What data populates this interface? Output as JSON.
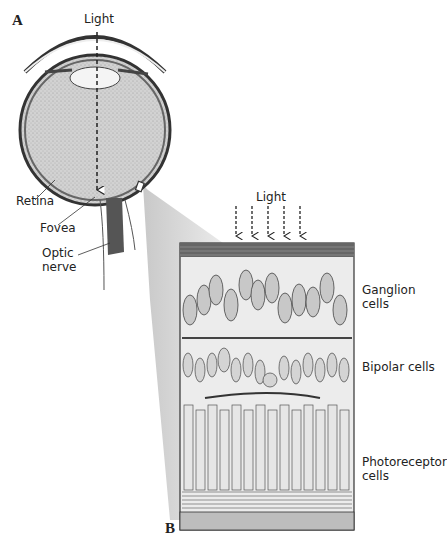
{
  "figure": {
    "panel_a": {
      "letter": "A",
      "light_label": "Light",
      "labels": {
        "retina": "Retina",
        "fovea": "Fovea",
        "optic_nerve_line1": "Optic",
        "optic_nerve_line2": "nerve"
      }
    },
    "panel_b": {
      "letter": "B",
      "light_label": "Light",
      "layers": {
        "ganglion_line1": "Ganglion",
        "ganglion_line2": "cells",
        "bipolar": "Bipolar cells",
        "photoreceptor_line1": "Photoreceptor",
        "photoreceptor_line2": "cells"
      },
      "light_arrow_count": 5
    }
  },
  "colors": {
    "ink": "#222222",
    "tissue": "#c8c8c8",
    "dark": "#555555",
    "background": "#ffffff"
  }
}
